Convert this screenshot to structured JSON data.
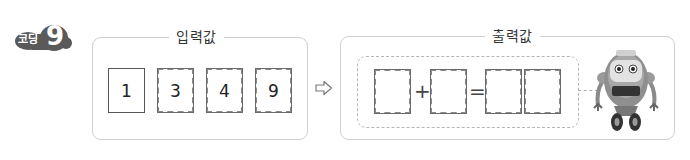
{
  "badge": {
    "label": "코딩",
    "number": "9"
  },
  "input_panel": {
    "title": "입력값",
    "cards": [
      {
        "value": "1",
        "style": "solid"
      },
      {
        "value": "3",
        "style": "dashed"
      },
      {
        "value": "4",
        "style": "dashed"
      },
      {
        "value": "9",
        "style": "dashed"
      }
    ]
  },
  "arrow": {
    "icon": "hollow-right-arrow-icon"
  },
  "output_panel": {
    "title": "출력값",
    "equation": {
      "slots": [
        "",
        "",
        "",
        ""
      ],
      "plus": "+",
      "equals": "="
    },
    "robot": {
      "icon": "robot-icon"
    }
  },
  "colors": {
    "border": "#cfcfcf",
    "badge": "#555555",
    "card_border": "#555555"
  }
}
